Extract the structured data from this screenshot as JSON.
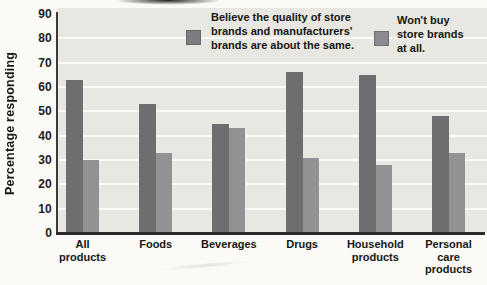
{
  "figure": {
    "kind": "scanned grouped bar chart",
    "page_bg": "#fbfaf6"
  },
  "chart_data": {
    "type": "bar",
    "title": "",
    "xlabel": "",
    "ylabel": "Percentage responding",
    "ylim": [
      0,
      90
    ],
    "ytick_step": 10,
    "y_ticks": [
      0,
      10,
      20,
      30,
      40,
      50,
      60,
      70,
      80,
      90
    ],
    "grid": "horizontal",
    "legend_position": "top",
    "categories": [
      "All products",
      "Foods",
      "Beverages",
      "Drugs",
      "Household products",
      "Personal care products"
    ],
    "category_label_lines": [
      [
        "All",
        "products"
      ],
      [
        "Foods"
      ],
      [
        "Beverages"
      ],
      [
        "Drugs"
      ],
      [
        "Household",
        "products"
      ],
      [
        "Personal",
        "care",
        "products"
      ]
    ],
    "series": [
      {
        "name": "Believe the quality of store brands and manufacturers' brands are about the same.",
        "color": "#6e6e70",
        "values": [
          63,
          53,
          45,
          66,
          65,
          48
        ]
      },
      {
        "name": "Won't buy store brands at all.",
        "color": "#929295",
        "values": [
          30,
          33,
          43,
          31,
          28,
          33
        ]
      }
    ]
  },
  "legend": {
    "items": [
      {
        "lines": [
          "Believe the quality of store",
          "brands and manufacturers'",
          "brands are about the same."
        ],
        "swatch_color": "#7d7d81"
      },
      {
        "lines": [
          "Won't buy",
          "store brands",
          "at all."
        ],
        "swatch_color": "#8b8b8f"
      }
    ]
  },
  "colors": {
    "panel_bg": "#e8e7e2",
    "gridline": "#fafaf7",
    "axis_line": "#2b2b29",
    "text": "#191917",
    "series1": "#6e6e70",
    "series2": "#929295"
  }
}
